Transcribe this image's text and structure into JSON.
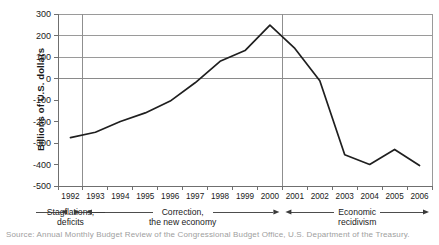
{
  "chart_data": {
    "type": "line",
    "title": "",
    "xlabel": "",
    "ylabel": "Billions of U.S. dollars",
    "categories": [
      "1992",
      "1993",
      "1994",
      "1995",
      "1996",
      "1997",
      "1998",
      "1999",
      "2000",
      "2001",
      "2002",
      "2003",
      "2004",
      "2005",
      "2006"
    ],
    "x": [
      1992,
      1993,
      1994,
      1995,
      1996,
      1997,
      1998,
      1999,
      2000,
      2001,
      2002,
      2003,
      2004,
      2005,
      2006
    ],
    "values": [
      -275,
      -250,
      -200,
      -160,
      -105,
      -20,
      80,
      130,
      248,
      140,
      -10,
      -355,
      -400,
      -330,
      -405
    ],
    "series": [
      {
        "name": "U.S. federal budget balance",
        "values": [
          -275,
          -250,
          -200,
          -160,
          -105,
          -20,
          80,
          130,
          248,
          140,
          -10,
          -355,
          -400,
          -330,
          -405
        ]
      }
    ],
    "ylim": [
      -500,
      300
    ],
    "yticks": [
      300,
      200,
      100,
      0,
      -100,
      -200,
      -300,
      -400,
      -500
    ],
    "ytick_labels": [
      "300",
      "200",
      "100",
      "0",
      "-100",
      "-200",
      "-300",
      "-400",
      "-500"
    ],
    "xlim": [
      1991.5,
      2006.5
    ],
    "grid": true,
    "legend": "none",
    "zero_line": true,
    "vertical_dividers": [
      1992.5,
      2000.5
    ],
    "annotations": [
      {
        "label_line1": "Stagflations,",
        "label_line2": "deficits",
        "from": 1991.5,
        "to": 1992.5
      },
      {
        "label_line1": "Correction,",
        "label_line2": "the new economy",
        "from": 1992.5,
        "to": 2000.5
      },
      {
        "label_line1": "Economic",
        "label_line2": "recidivism",
        "from": 2000.5,
        "to": 2006.5
      }
    ]
  },
  "axis": {
    "y_title": "Billions of U.S. dollars"
  },
  "caption": {
    "clipped_text": "Source: Annual Monthly Budget Review of the Congressional Budget Office, U.S. Department of the Treasury."
  },
  "colors": {
    "series": "#1f1f1f",
    "grid": "#9a9a9a",
    "axis": "#6f6f6f",
    "text": "#1a1a1a"
  }
}
